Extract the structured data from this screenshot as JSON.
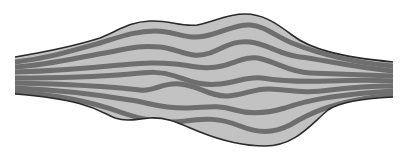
{
  "diagram": {
    "title": "",
    "description": "Spindle-shaped bundle with wavy fiber bands",
    "colors": {
      "background": "#ffffff",
      "fill": "#c2c2c2",
      "band": "#6e6e6e",
      "outline": "#2a2a2a"
    },
    "outline": {
      "top": "M15,57 C45,52 75,46 100,38 C118,31 128,22 150,21 C170,20 180,27 197,25 C215,22 225,14 245,14 C262,14 275,22 292,35 C310,49 340,57 393,62",
      "bottom": "M393,97 C360,99 340,102 328,110 C310,125 295,146 265,146 C240,146 220,140 200,132 C180,124 168,117 150,118 C135,119 128,122 115,118 C100,112 90,100 15,94"
    },
    "bands": [
      {
        "d": "M15,62 C50,58 75,50 100,43 C120,37 135,31 155,31 C175,31 185,40 205,36 C225,32 235,24 250,25 C265,26 275,36 292,43 C312,51 345,62 393,66"
      },
      {
        "d": "M15,67 C50,65 80,57 110,52 C130,48 140,45 160,47 C180,49 190,60 210,53 C225,47 235,40 250,42 C268,44 280,55 300,57 C320,59 350,67 393,71"
      },
      {
        "d": "M15,72 C55,71 90,68 120,65 C145,63 155,62 175,64 C195,66 205,70 222,66 C238,62 248,55 262,59 C278,63 290,72 310,73 C335,74 360,75 393,76"
      },
      {
        "d": "M15,78 C55,78 95,77 130,74 C150,72 160,71 175,76 C190,81 200,86 220,84 C238,82 248,76 262,78 C280,81 300,82 330,81 C355,80 375,80 393,81"
      },
      {
        "d": "M15,83 C60,84 105,86 140,90 C155,92 162,82 180,84 C200,86 210,97 228,96 C245,95 255,88 270,89 C290,90 305,94 330,90 C355,87 375,86 393,86"
      },
      {
        "d": "M15,88 C60,90 100,95 130,100 C150,103 160,108 185,108 C205,108 215,104 235,110 C252,115 268,113 285,108 C305,101 330,95 393,91"
      },
      {
        "d": "M15,92 C60,95 95,103 120,112 C140,119 160,124 185,121 C205,118 220,118 240,126 C258,133 272,134 290,125 C305,116 330,101 393,95"
      }
    ],
    "stripes_left": [
      60,
      65,
      70,
      75,
      80,
      85,
      90
    ],
    "stripes_right": [
      64,
      69,
      74,
      79,
      84,
      89,
      94
    ]
  }
}
